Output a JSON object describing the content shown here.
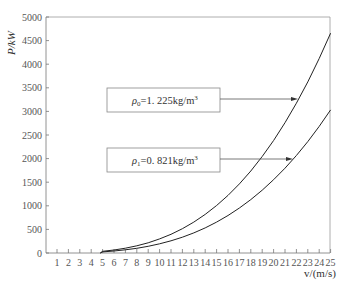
{
  "chart_data": {
    "type": "line",
    "title": "",
    "xlabel": "v/(m/s)",
    "ylabel": "P/kW",
    "xlim": [
      0,
      25
    ],
    "ylim": [
      0,
      5000
    ],
    "grid": false,
    "x_ticks": [
      1,
      2,
      3,
      4,
      5,
      6,
      7,
      8,
      9,
      10,
      11,
      12,
      13,
      14,
      15,
      16,
      17,
      18,
      19,
      20,
      21,
      22,
      23,
      24,
      25
    ],
    "y_ticks": [
      0,
      500,
      1000,
      1500,
      2000,
      2500,
      3000,
      3500,
      4000,
      4500,
      5000
    ],
    "x": [
      5,
      6,
      7,
      8,
      9,
      10,
      11,
      12,
      13,
      14,
      15,
      16,
      17,
      18,
      19,
      20,
      21,
      22,
      23,
      24,
      25
    ],
    "series": [
      {
        "name": "ρ0=1.225kg/m³",
        "values": [
          37,
          64,
          102,
          153,
          217,
          298,
          397,
          515,
          655,
          818,
          1006,
          1221,
          1464,
          1738,
          2044,
          2384,
          2760,
          3173,
          3626,
          4120,
          4656
        ]
      },
      {
        "name": "ρ1=0.821kg/m³",
        "values": [
          24,
          42,
          67,
          99,
          141,
          194,
          258,
          335,
          426,
          532,
          655,
          795,
          953,
          1131,
          1331,
          1552,
          1797,
          2066,
          2360,
          2682,
          3031
        ]
      }
    ],
    "annotations": [
      {
        "text": "ρ0=1.225kg/m³",
        "points_to": "upper curve at v≈21.6"
      },
      {
        "text": "ρ1=0.821kg/m³",
        "points_to": "lower curve at v≈21.3"
      }
    ],
    "legend_position": "inline boxed annotations with arrows"
  },
  "labels": {
    "ylabel": "P/kW",
    "xlabel": "v/(m/s)",
    "box0_sym": "ρ",
    "box0_sub": "0",
    "box0_rest": "=1. 225kg/m",
    "box1_sym": "ρ",
    "box1_sub": "1",
    "box1_rest": "=0. 821kg/m",
    "sup": "3"
  }
}
